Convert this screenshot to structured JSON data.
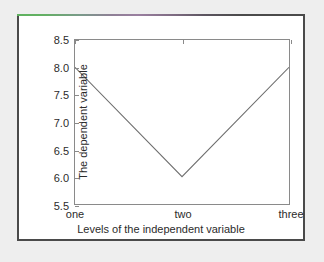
{
  "figure": {
    "accent_start_color": "#5fb25f",
    "accent_mid_color": "#9a7fa0",
    "accent_end_color": "#4a4a4a",
    "frame_color": "#4a4a4a",
    "background_color": "#ffffff",
    "page_background_color": "#eeeeee"
  },
  "chart_data": {
    "type": "line",
    "title": "",
    "xlabel": "Levels of the independent variable",
    "ylabel": "The dependent variable",
    "categories": [
      "one",
      "two",
      "three"
    ],
    "values": [
      8.0,
      6.0,
      8.0
    ],
    "series": [
      {
        "name": "",
        "values": [
          8.0,
          6.0,
          8.0
        ]
      }
    ],
    "ylim": [
      5.5,
      8.5
    ],
    "yticks": [
      5.5,
      6.0,
      6.5,
      7.0,
      7.5,
      8.0,
      8.5
    ],
    "ytick_labels": [
      "5.5",
      "6.0",
      "6.5",
      "7.0",
      "7.5",
      "8.0",
      "8.5"
    ],
    "xtick_labels": [
      "one",
      "two",
      "three"
    ],
    "grid": false,
    "legend": false,
    "legend_position": "none",
    "line_color": "#6e6e6e",
    "axis_color": "#8a8a8a",
    "markers": false
  }
}
